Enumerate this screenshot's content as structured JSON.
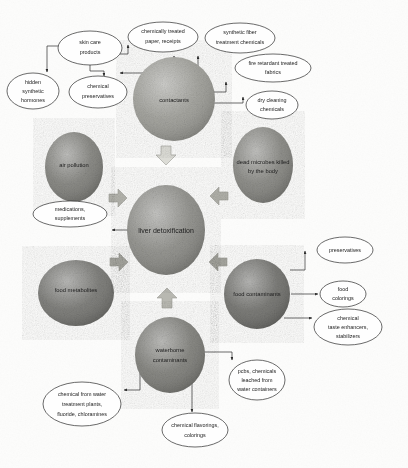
{
  "diagram": {
    "type": "concept-map",
    "colors": {
      "blob_dark": "#6f6f6b",
      "blob_mid": "#8c8c87",
      "blob_light": "#a9a9a3",
      "ellipse_fill": "#fefefe",
      "stroke": "#2b2b2b",
      "block_arrow_light": "#d8d8d2",
      "block_arrow_mid": "#b4b4ad",
      "background": "#fdfdfc"
    },
    "center": {
      "id": "liver-detoxification",
      "label": "liver detoxification",
      "shape": "blob",
      "cx": 166,
      "cy": 230,
      "rx": 39,
      "ry": 45,
      "tone": "#8a8a85"
    },
    "blobs": [
      {
        "id": "contactants",
        "label": "contactants",
        "cx": 174,
        "cy": 99,
        "rx": 41,
        "ry": 42,
        "tone": "#9b9b95"
      },
      {
        "id": "air-pollution",
        "label": "air pollution",
        "cx": 74,
        "cy": 167,
        "rx": 29,
        "ry": 35,
        "tone": "#7e7e79"
      },
      {
        "id": "dead-microbes-killed-by-the-body",
        "label": "dead microbes killed by the body",
        "label_lines": [
          "dead microbes killed",
          "by the body"
        ],
        "cx": 263,
        "cy": 165,
        "rx": 30,
        "ry": 38,
        "tone": "#83837e"
      },
      {
        "id": "food-metabolites",
        "label": "food metabolites",
        "cx": 76,
        "cy": 293,
        "rx": 38,
        "ry": 33,
        "tone": "#73736f"
      },
      {
        "id": "food-contaminants",
        "label": "food contaminants",
        "cx": 257,
        "cy": 294,
        "rx": 33,
        "ry": 35,
        "tone": "#6d6d69"
      },
      {
        "id": "waterborne-contaminants",
        "label": "waterborne contaminants",
        "label_lines": [
          "waterborne",
          "contaminants"
        ],
        "cx": 170,
        "cy": 355,
        "rx": 35,
        "ry": 38,
        "tone": "#7b7b76"
      }
    ],
    "ellipses": [
      {
        "id": "skin-care-products",
        "label": "skin care products",
        "label_lines": [
          "skin care",
          "products"
        ],
        "cx": 90,
        "cy": 48,
        "rx": 32,
        "ry": 17
      },
      {
        "id": "chemically-treated-paper-receipts",
        "label": "chemically treated paper, receipts",
        "label_lines": [
          "chemically treated",
          "paper, receipts"
        ],
        "cx": 163,
        "cy": 37,
        "rx": 35,
        "ry": 15
      },
      {
        "id": "synthetic-fiber-treatment-chemicals",
        "label": "synthetic fiber treatment chemicals",
        "label_lines": [
          "synthetic fiber",
          "treatment chemicals"
        ],
        "cx": 240,
        "cy": 38,
        "rx": 35,
        "ry": 15
      },
      {
        "id": "fire-retardant-treated-fabrics",
        "label": "fire retardant treated fabrics",
        "label_lines": [
          "fire retardant treated",
          "fabrics"
        ],
        "cx": 273,
        "cy": 68,
        "rx": 38,
        "ry": 14
      },
      {
        "id": "dry-cleaning-chemicals",
        "label": "dry cleaning chemicals",
        "label_lines": [
          "dry cleaning",
          "chemicals"
        ],
        "cx": 272,
        "cy": 105,
        "rx": 26,
        "ry": 14
      },
      {
        "id": "hidden-synthetic-hormones",
        "label": "hidden synthetic hormones",
        "label_lines": [
          "hidden",
          "synthetic",
          "hormones"
        ],
        "cx": 33,
        "cy": 91,
        "rx": 26,
        "ry": 18
      },
      {
        "id": "chemical-preservatives",
        "label": "chemical preservatives",
        "label_lines": [
          "chemical",
          "preservatives"
        ],
        "cx": 98,
        "cy": 92,
        "rx": 29,
        "ry": 16
      },
      {
        "id": "medications-supplements",
        "label": "medications, supplements",
        "label_lines": [
          "medications,",
          "supplements"
        ],
        "cx": 70,
        "cy": 214,
        "rx": 37,
        "ry": 13
      },
      {
        "id": "preservatives",
        "label": "preservatives",
        "label_lines": [
          "preservatives"
        ],
        "cx": 345,
        "cy": 250,
        "rx": 28,
        "ry": 13
      },
      {
        "id": "food-colorings",
        "label": "food colorings",
        "label_lines": [
          "food",
          "colorings"
        ],
        "cx": 343,
        "cy": 294,
        "rx": 23,
        "ry": 13
      },
      {
        "id": "chemical-taste-enhancers-stabilizers",
        "label": "chemical taste enhancers, stabilizers",
        "label_lines": [
          "chemical",
          "taste enhancers,",
          "stabilizers"
        ],
        "cx": 348,
        "cy": 327,
        "rx": 34,
        "ry": 18
      },
      {
        "id": "pcbs-chemicals-leached-from-water-containers",
        "label": "pcbs, chemicals leached from water containers",
        "label_lines": [
          "pcbs, chemicals",
          "leached from",
          "water containers"
        ],
        "cx": 257,
        "cy": 380,
        "rx": 28,
        "ry": 20
      },
      {
        "id": "chemical-from-water-treatment-plants-fluoride-chloramines",
        "label": "chemical from water treatment plants, fluoride, chloramines",
        "label_lines": [
          "chemical from water",
          "treatment plants,",
          "fluoride, chloramines"
        ],
        "cx": 82,
        "cy": 404,
        "rx": 39,
        "ry": 22
      },
      {
        "id": "chemical-flavorings-colorings",
        "label": "chemical flavorings, colorings",
        "label_lines": [
          "chemical flavorings,",
          "colorings"
        ],
        "cx": 195,
        "cy": 430,
        "rx": 33,
        "ry": 17
      }
    ],
    "block_arrows": [
      {
        "id": "block-arrow-down-contactants",
        "direction": "down",
        "x": 166,
        "y": 157,
        "size": 11,
        "tone": "#dcdcd6"
      },
      {
        "id": "block-arrow-up-waterborne",
        "direction": "up",
        "x": 167,
        "y": 297,
        "size": 11,
        "tone": "#b8b8b1"
      },
      {
        "id": "block-arrow-right-air-pollution",
        "direction": "right",
        "x": 115,
        "y": 198,
        "size": 10,
        "tone": "#b4b4ad"
      },
      {
        "id": "block-arrow-left-dead-microbes",
        "direction": "left",
        "x": 220,
        "y": 196,
        "size": 10,
        "tone": "#b0b0a9"
      },
      {
        "id": "block-arrow-right-food-metabolites",
        "direction": "right",
        "x": 116,
        "y": 262,
        "size": 10,
        "tone": "#a8a8a1"
      },
      {
        "id": "block-arrow-left-food-contaminants",
        "direction": "left",
        "x": 219,
        "y": 262,
        "size": 10,
        "tone": "#a5a59e"
      }
    ],
    "connectors": [
      {
        "id": "conn-contactants-to-left",
        "from": "contactants",
        "to": "skin-care-area"
      },
      {
        "id": "conn-contactants-up",
        "from": "contactants",
        "to": "chemically-treated-paper-receipts"
      },
      {
        "id": "conn-contactants-synthetic",
        "from": "contactants",
        "to": "synthetic-fiber-treatment-chemicals"
      },
      {
        "id": "conn-contactants-fire",
        "from": "contactants",
        "to": "fire-retardant-treated-fabrics"
      },
      {
        "id": "conn-contactants-dry",
        "from": "contactants",
        "to": "dry-cleaning-chemicals"
      },
      {
        "id": "conn-skin-to-paper",
        "from": "skin-care-products",
        "to": "chemically-treated-paper-receipts"
      },
      {
        "id": "conn-skin-to-hidden",
        "from": "skin-care-products",
        "to": "hidden-synthetic-hormones"
      },
      {
        "id": "conn-skin-to-preservatives",
        "from": "skin-care-products",
        "to": "chemical-preservatives"
      },
      {
        "id": "conn-liver-to-medications",
        "from": "liver-detoxification",
        "to": "medications-supplements"
      },
      {
        "id": "conn-food-to-preservatives",
        "from": "food-contaminants",
        "to": "preservatives"
      },
      {
        "id": "conn-food-to-colorings",
        "from": "food-contaminants",
        "to": "food-colorings"
      },
      {
        "id": "conn-food-to-enhancers",
        "from": "food-contaminants",
        "to": "chemical-taste-enhancers-stabilizers"
      },
      {
        "id": "conn-water-to-pcbs",
        "from": "waterborne-contaminants",
        "to": "pcbs-chemicals-leached-from-water-containers"
      },
      {
        "id": "conn-water-to-treatment",
        "from": "waterborne-contaminants",
        "to": "chemical-from-water-treatment-plants-fluoride-chloramines"
      },
      {
        "id": "conn-water-to-flavorings",
        "from": "waterborne-contaminants",
        "to": "chemical-flavorings-colorings"
      }
    ]
  }
}
